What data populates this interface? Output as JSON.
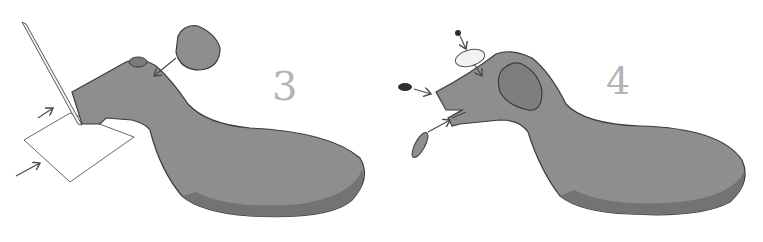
{
  "illustration": {
    "description": "Two-step instructional illustration for sculpting a clay dog",
    "colors": {
      "clay_body": "#8e8e8e",
      "clay_shadow": "#6f6f6f",
      "outline": "#3c3c3c",
      "step_number": "#b4b4b4",
      "paper": "#ffffff",
      "nose": "#2e2e2e",
      "eye_white": "#f2f2f2"
    },
    "steps": [
      {
        "number": "3",
        "label": "Shape head with knife and add ear piece",
        "elements": [
          "clay-body",
          "clay-ball-ear",
          "knife-blade",
          "paper-card",
          "arrow-ear",
          "arrow-upper",
          "arrow-lower"
        ]
      },
      {
        "number": "4",
        "label": "Add nose, eye and tongue",
        "elements": [
          "clay-body",
          "ear",
          "nose",
          "eye-disc",
          "eye-pupil",
          "tongue",
          "arrow-nose",
          "arrow-eye",
          "arrow-pupil",
          "arrow-tongue"
        ]
      }
    ]
  }
}
